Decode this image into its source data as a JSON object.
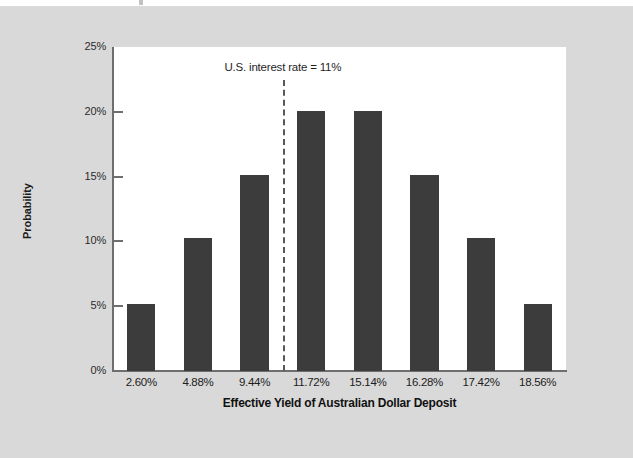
{
  "chart_data": {
    "type": "bar",
    "title": "",
    "xlabel": "Effective Yield of Australian Dollar Deposit",
    "ylabel": "Probability",
    "categories": [
      "2.60%",
      "4.88%",
      "9.44%",
      "11.72%",
      "15.14%",
      "16.28%",
      "17.42%",
      "18.56%"
    ],
    "values": [
      5.2,
      10.3,
      15.1,
      20.1,
      20.1,
      15.1,
      10.3,
      5.2
    ],
    "ylim": [
      0,
      25
    ],
    "yticks": [
      0,
      5,
      10,
      15,
      20,
      25
    ],
    "ytick_labels": [
      "0%",
      "5%",
      "10%",
      "15%",
      "20%",
      "25%"
    ],
    "grid": false,
    "legend": "none",
    "bar_color": "#3c3c3c",
    "plot_background": "#ffffff",
    "figure_background": "#d9d9d9",
    "annotations": [
      {
        "name": "us-interest-rate-line",
        "text": "U.S. interest rate = 11%",
        "line_style": "dashed",
        "line_color": "#585858",
        "between_categories": [
          "9.44%",
          "11.72%"
        ],
        "value": 11
      }
    ]
  }
}
